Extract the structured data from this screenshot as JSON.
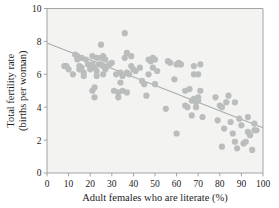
{
  "figure": {
    "background_color": "#ffffff",
    "plot_background_color": "#f3f3f1",
    "frame_color": "#9a9a9a",
    "point_color": "#b9bdbc",
    "line_color": "#a9adac",
    "text_color": "#1d1d1d"
  },
  "chart_data": {
    "type": "scatter",
    "title": "",
    "xlabel": "Adult females who are literate (%)",
    "ylabel": "Total fertility rate (births per woman)",
    "ylabel_line1": "Total fertility rate",
    "ylabel_line2": "(births per woman)",
    "xlim": [
      0,
      100
    ],
    "ylim": [
      0,
      10
    ],
    "xticks": [
      0,
      10,
      20,
      30,
      40,
      50,
      60,
      70,
      80,
      90,
      100
    ],
    "yticks": [
      0,
      2,
      4,
      6,
      8,
      10
    ],
    "xtick_labels": [
      "0",
      "10",
      "20",
      "30",
      "40",
      "50",
      "60",
      "70",
      "80",
      "90",
      "100"
    ],
    "ytick_labels": [
      "0",
      "2",
      "4",
      "6",
      "8",
      "10"
    ],
    "grid": false,
    "legend": false,
    "marker": "circle",
    "marker_size": 3.1,
    "n_points": 106,
    "points": [
      [
        8,
        6.5
      ],
      [
        9,
        6.5
      ],
      [
        10,
        6.3
      ],
      [
        12,
        6.0
      ],
      [
        13,
        7.2
      ],
      [
        14,
        7.1
      ],
      [
        14,
        6.9
      ],
      [
        15,
        6.5
      ],
      [
        15,
        6.3
      ],
      [
        16,
        7.0
      ],
      [
        16,
        6.4
      ],
      [
        17,
        6.1
      ],
      [
        17,
        5.9
      ],
      [
        18,
        6.9
      ],
      [
        19,
        6.6
      ],
      [
        20,
        6.3
      ],
      [
        21,
        7.1
      ],
      [
        21,
        6.6
      ],
      [
        21,
        5.0
      ],
      [
        22,
        6.4
      ],
      [
        22,
        5.2
      ],
      [
        22,
        4.6
      ],
      [
        23,
        7.0
      ],
      [
        23,
        6.2
      ],
      [
        23,
        5.9
      ],
      [
        24,
        6.6
      ],
      [
        25,
        7.8
      ],
      [
        25,
        7.0
      ],
      [
        25,
        6.6
      ],
      [
        26,
        7.1
      ],
      [
        26,
        6.5
      ],
      [
        26,
        6.0
      ],
      [
        27,
        6.9
      ],
      [
        27,
        6.3
      ],
      [
        28,
        6.5
      ],
      [
        29,
        6.6
      ],
      [
        30,
        6.7
      ],
      [
        31,
        5.0
      ],
      [
        32,
        6.0
      ],
      [
        33,
        4.9
      ],
      [
        33,
        4.6
      ],
      [
        34,
        6.1
      ],
      [
        34,
        5.5
      ],
      [
        35,
        5.9
      ],
      [
        35,
        5.0
      ],
      [
        36,
        8.5
      ],
      [
        36,
        7.0
      ],
      [
        37,
        7.3
      ],
      [
        37,
        6.1
      ],
      [
        37,
        4.9
      ],
      [
        38,
        6.0
      ],
      [
        39,
        7.1
      ],
      [
        39,
        6.5
      ],
      [
        40,
        6.3
      ],
      [
        41,
        6.2
      ],
      [
        43,
        6.4
      ],
      [
        44,
        5.6
      ],
      [
        45,
        5.4
      ],
      [
        46,
        4.7
      ],
      [
        47,
        6.9
      ],
      [
        47,
        6.0
      ],
      [
        48,
        6.8
      ],
      [
        49,
        7.0
      ],
      [
        49,
        6.4
      ],
      [
        50,
        6.9
      ],
      [
        50,
        5.4
      ],
      [
        51,
        6.2
      ],
      [
        55,
        3.9
      ],
      [
        56,
        6.8
      ],
      [
        57,
        6.7
      ],
      [
        59,
        5.7
      ],
      [
        60,
        6.6
      ],
      [
        60,
        2.4
      ],
      [
        61,
        6.7
      ],
      [
        62,
        6.6
      ],
      [
        64,
        5.0
      ],
      [
        64,
        4.1
      ],
      [
        65,
        4.0
      ],
      [
        66,
        5.1
      ],
      [
        67,
        4.4
      ],
      [
        67,
        3.5
      ],
      [
        68,
        6.5
      ],
      [
        68,
        6.0
      ],
      [
        68,
        4.5
      ],
      [
        69,
        4.3
      ],
      [
        69,
        4.0
      ],
      [
        70,
        6.0
      ],
      [
        70,
        4.6
      ],
      [
        70,
        4.4
      ],
      [
        71,
        6.6
      ],
      [
        71,
        5.0
      ],
      [
        72,
        3.4
      ],
      [
        78,
        4.6
      ],
      [
        79,
        3.2
      ],
      [
        80,
        4.1
      ],
      [
        81,
        4.0
      ],
      [
        81,
        1.6
      ],
      [
        82,
        2.7
      ],
      [
        83,
        4.3
      ],
      [
        84,
        4.7
      ],
      [
        85,
        3.1
      ],
      [
        86,
        2.4
      ],
      [
        87,
        4.3
      ],
      [
        87,
        1.9
      ],
      [
        88,
        1.5
      ],
      [
        89,
        3.3
      ],
      [
        90,
        2.9
      ],
      [
        91,
        1.8
      ],
      [
        92,
        1.9
      ],
      [
        93,
        3.4
      ],
      [
        93,
        2.5
      ],
      [
        94,
        2.3
      ],
      [
        95,
        1.4
      ],
      [
        96,
        3.0
      ],
      [
        96,
        2.6
      ],
      [
        97,
        2.6
      ]
    ],
    "trend_line": {
      "type": "linear-fit",
      "x_start": 0,
      "y_start": 7.9,
      "x_end": 100,
      "y_end": 2.75,
      "slope": -0.0515,
      "intercept": 7.9
    }
  }
}
